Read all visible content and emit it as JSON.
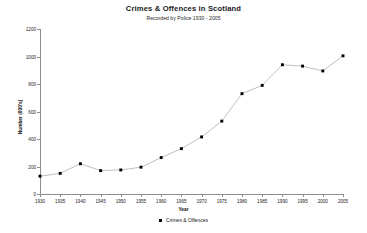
{
  "chart_data": {
    "type": "line",
    "title": "Crimes & Offences in Scotland",
    "subtitle": "Recorded by Police 1930 - 2005",
    "xlabel": "Year",
    "ylabel": "Number (000's)",
    "xlim": [
      1930,
      2005
    ],
    "ylim": [
      0,
      1200
    ],
    "xticks": [
      1930,
      1935,
      1940,
      1945,
      1950,
      1955,
      1960,
      1965,
      1970,
      1975,
      1980,
      1985,
      1990,
      1995,
      2000,
      2005
    ],
    "yticks": [
      0,
      200,
      400,
      600,
      800,
      1000,
      1200
    ],
    "grid": false,
    "legend_position": "bottom",
    "x": [
      1930,
      1935,
      1940,
      1945,
      1950,
      1955,
      1960,
      1965,
      1970,
      1975,
      1980,
      1985,
      1990,
      1995,
      2000,
      2005
    ],
    "series": [
      {
        "name": "Crimes & Offences",
        "marker": "square",
        "marker_color": "#000000",
        "line_color": "#b9b9b9",
        "values": [
          130,
          150,
          220,
          170,
          175,
          195,
          265,
          330,
          415,
          530,
          730,
          790,
          940,
          930,
          895,
          1005
        ]
      }
    ]
  },
  "legend": {
    "entries": [
      {
        "label": "Crimes & Offences",
        "swatch": "legend-marker-square"
      }
    ]
  },
  "colors": {
    "background": "#ffffff",
    "axis": "#8d8d8d",
    "marker": "#000000",
    "line": "#b9b9b9",
    "text": "#111111"
  }
}
